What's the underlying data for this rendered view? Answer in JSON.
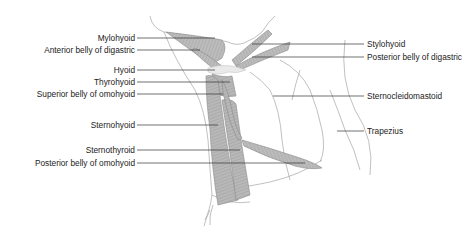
{
  "figure": {
    "left_labels": [
      {
        "text": "Mylohyoid",
        "y": 38
      },
      {
        "text": "Anterior belly of digastric",
        "y": 50
      },
      {
        "text": "Hyoid",
        "y": 70
      },
      {
        "text": "Thyrohyoid",
        "y": 82
      },
      {
        "text": "Superior belly of omohyoid",
        "y": 94
      },
      {
        "text": "Sternohyoid",
        "y": 125
      },
      {
        "text": "Sternothyroid",
        "y": 150
      },
      {
        "text": "Posterior belly of omohyoid",
        "y": 163
      }
    ],
    "right_labels": [
      {
        "text": "Stylohyoid",
        "y": 44
      },
      {
        "text": "Posterior belly of digastric",
        "y": 57
      },
      {
        "text": "Sternocleidomastoid",
        "y": 96
      },
      {
        "text": "Trapezius",
        "y": 131
      }
    ],
    "colors": {
      "muscle_fill": "#b5b5b5",
      "muscle_stroke": "#8a8a8a",
      "outline": "#a0a0a0",
      "leader_line": "#333333",
      "text": "#222222"
    }
  }
}
